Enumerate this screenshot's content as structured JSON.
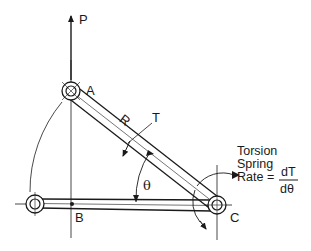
{
  "diagram": {
    "colors": {
      "ink": "#1a1a1a",
      "background": "#ffffff"
    },
    "labels": {
      "force": "P",
      "pivot_top": "A",
      "point_mid": "B",
      "pivot_right": "C",
      "link_length": "R",
      "torque": "T",
      "angle": "θ"
    },
    "annotation": {
      "line1": "Torsion",
      "line2": "Spring",
      "line3_prefix": "Rate =",
      "fraction_numerator": "dT",
      "fraction_denominator": "dθ"
    }
  }
}
